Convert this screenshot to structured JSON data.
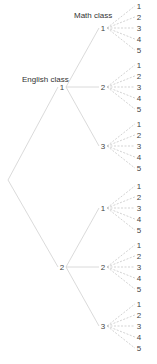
{
  "diagram": {
    "type": "tree",
    "level_labels": {
      "level1": "English class",
      "level2": "Math class"
    },
    "root": "",
    "level1_nodes": [
      "1",
      "2"
    ],
    "level2_nodes": [
      "1",
      "2",
      "3"
    ],
    "leaf_nodes": [
      "1",
      "2",
      "3",
      "4",
      "5"
    ],
    "colors": {
      "solid_line": "#d0d0d0",
      "dashed_line": "#c8c8c8",
      "text": "#333333"
    }
  }
}
